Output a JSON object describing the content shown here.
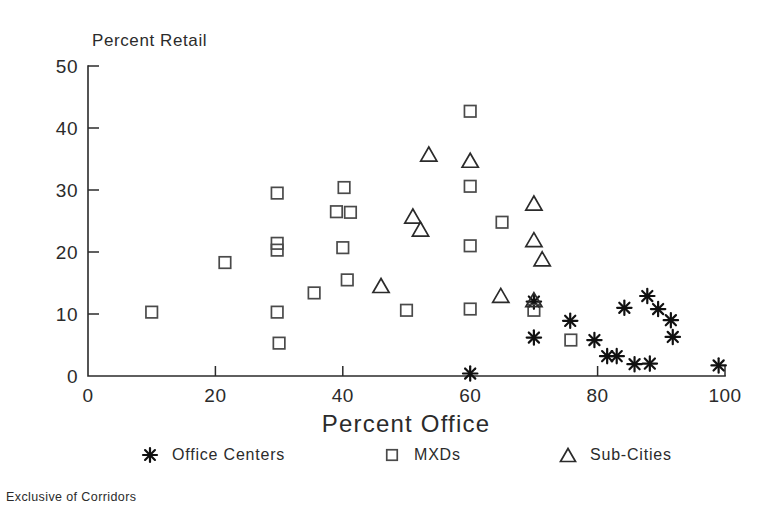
{
  "chart_data": {
    "type": "scatter",
    "title": "",
    "xlabel": "Percent Office",
    "ylabel": "Percent Retail",
    "xlim": [
      0,
      100
    ],
    "ylim": [
      0,
      50
    ],
    "xticks": [
      0,
      20,
      40,
      60,
      80,
      100
    ],
    "yticks": [
      0,
      10,
      20,
      30,
      40,
      50
    ],
    "grid": false,
    "legend_position": "below-axes",
    "footnote": "Exclusive of Corridors",
    "series": [
      {
        "name": "Office Centers",
        "marker": "asterisk",
        "points": [
          [
            60.0,
            0.4
          ],
          [
            70.0,
            12.0
          ],
          [
            70.0,
            6.2
          ],
          [
            75.7,
            8.9
          ],
          [
            79.5,
            5.8
          ],
          [
            81.5,
            3.2
          ],
          [
            83.0,
            3.2
          ],
          [
            84.2,
            11.0
          ],
          [
            85.8,
            1.9
          ],
          [
            87.8,
            12.9
          ],
          [
            88.2,
            2.0
          ],
          [
            89.5,
            10.8
          ],
          [
            91.5,
            9.0
          ],
          [
            91.8,
            6.3
          ],
          [
            99.0,
            1.7
          ]
        ]
      },
      {
        "name": "MXDs",
        "marker": "square",
        "points": [
          [
            10.0,
            10.3
          ],
          [
            21.5,
            18.3
          ],
          [
            29.7,
            29.5
          ],
          [
            29.7,
            21.4
          ],
          [
            29.7,
            20.3
          ],
          [
            29.7,
            10.3
          ],
          [
            30.0,
            5.3
          ],
          [
            35.5,
            13.4
          ],
          [
            40.2,
            30.4
          ],
          [
            39.0,
            26.5
          ],
          [
            41.2,
            26.4
          ],
          [
            40.0,
            20.7
          ],
          [
            40.7,
            15.5
          ],
          [
            50.0,
            10.6
          ],
          [
            60.0,
            42.7
          ],
          [
            60.0,
            30.6
          ],
          [
            60.0,
            21.0
          ],
          [
            60.0,
            10.8
          ],
          [
            65.0,
            24.8
          ],
          [
            70.0,
            10.6
          ],
          [
            75.8,
            5.8
          ]
        ]
      },
      {
        "name": "Sub-Cities",
        "marker": "triangle",
        "points": [
          [
            46.0,
            14.6
          ],
          [
            51.0,
            25.8
          ],
          [
            52.2,
            23.7
          ],
          [
            53.5,
            35.8
          ],
          [
            60.0,
            34.8
          ],
          [
            64.8,
            13.0
          ],
          [
            70.0,
            27.9
          ],
          [
            70.0,
            22.0
          ],
          [
            71.3,
            18.9
          ],
          [
            70.0,
            12.3
          ]
        ]
      }
    ]
  },
  "legend": {
    "entries": [
      {
        "label": "Office Centers",
        "marker": "asterisk"
      },
      {
        "label": "MXDs",
        "marker": "square"
      },
      {
        "label": "Sub-Cities",
        "marker": "triangle"
      }
    ]
  },
  "colors": {
    "ink": "#2b2b2b",
    "marker_outline": "#4a4a4a",
    "star": "#111111",
    "background": "#ffffff"
  }
}
